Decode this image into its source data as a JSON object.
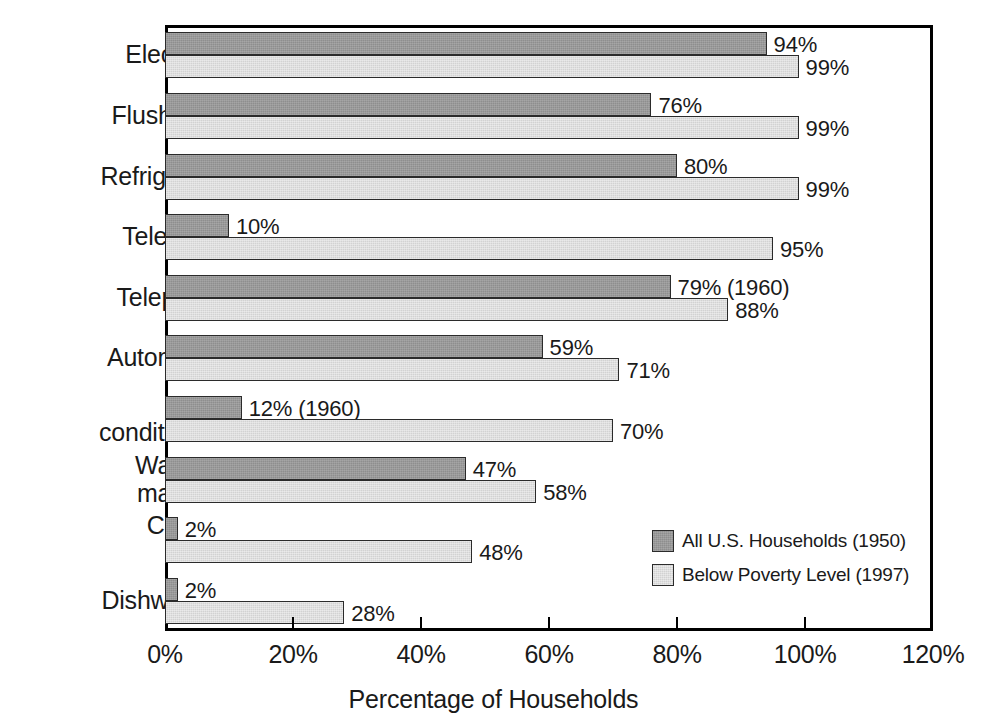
{
  "chart_data": {
    "type": "bar",
    "orientation": "horizontal",
    "title": "",
    "xlabel": "Percentage of Households",
    "ylabel": "",
    "xlim": [
      0,
      120
    ],
    "xticks": [
      0,
      20,
      40,
      60,
      80,
      100,
      120
    ],
    "xtick_labels": [
      "0%",
      "20%",
      "40%",
      "60%",
      "80%",
      "100%",
      "120%"
    ],
    "grid": false,
    "legend_position": "inside-lower-right",
    "categories": [
      "Electricity",
      "Flush toilet",
      "Refrigerator",
      "Television",
      "Telephone",
      "Automobile",
      "Air\nconditioning",
      "Washing\nmachine",
      "Clothes\ndryer",
      "Dishwasher"
    ],
    "series": [
      {
        "name": "All U.S. Households (1950)",
        "color": "#8e8e8e",
        "values": [
          94,
          76,
          80,
          10,
          79,
          59,
          12,
          47,
          2,
          2
        ],
        "labels": [
          "94%",
          "76%",
          "80%",
          "10%",
          "79% (1960)",
          "59%",
          "12% (1960)",
          "47%",
          "2%",
          "2%"
        ]
      },
      {
        "name": "Below Poverty Level (1997)",
        "color": "#d2d2d2",
        "values": [
          99,
          99,
          99,
          95,
          88,
          71,
          70,
          58,
          48,
          28
        ],
        "labels": [
          "99%",
          "99%",
          "99%",
          "95%",
          "88%",
          "71%",
          "70%",
          "58%",
          "48%",
          "28%"
        ]
      }
    ],
    "annotations": [
      "79% (1960)",
      "12% (1960)"
    ]
  },
  "legend": {
    "entries": [
      {
        "label": "All U.S. Households (1950)"
      },
      {
        "label": "Below Poverty Level (1997)"
      }
    ]
  }
}
